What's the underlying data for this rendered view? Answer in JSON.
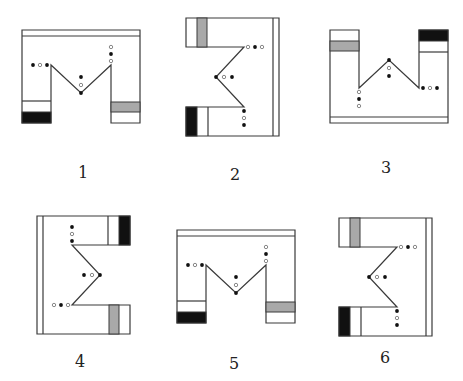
{
  "figures": [
    {
      "label": "1",
      "orientation": "upright",
      "mirror": false,
      "x": 22,
      "y": 30,
      "label_x": 83,
      "label_y": 163
    },
    {
      "label": "2",
      "orientation": "rotated-right",
      "mirror": false,
      "x": 188,
      "y": 18,
      "label_x": 235,
      "label_y": 165
    },
    {
      "label": "3",
      "orientation": "upside-down",
      "mirror": false,
      "x": 330,
      "y": 30,
      "label_x": 386,
      "label_y": 158
    },
    {
      "label": "4",
      "orientation": "rotated-left",
      "mirror": false,
      "x": 37,
      "y": 216,
      "label_x": 80,
      "label_y": 352
    },
    {
      "label": "5",
      "orientation": "upright",
      "mirror": false,
      "x": 177,
      "y": 230,
      "label_x": 234,
      "label_y": 354
    },
    {
      "label": "6",
      "orientation": "rotated-right",
      "mirror": false,
      "x": 341,
      "y": 218,
      "label_x": 385,
      "label_y": 348
    }
  ],
  "colors": {
    "stroke": "#3a3a3a",
    "black_band": "#111111",
    "grey_band": "#a9a9a9",
    "dot_black": "#111111",
    "dot_ring": "#888888"
  }
}
